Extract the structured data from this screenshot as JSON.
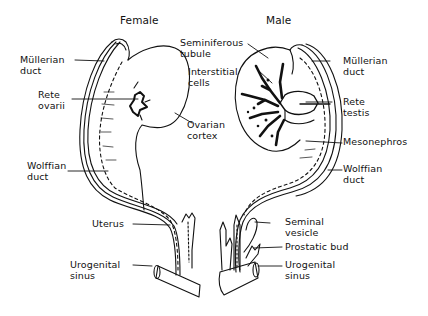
{
  "diagram": {
    "panels": {
      "female": {
        "title": "Female",
        "labels": {
          "mullerian_duct": "Müllerian\nduct",
          "rete_ovarii": "Rete\novarii",
          "ovarian_cortex": "Ovarian\ncortex",
          "wolffian_duct": "Wolffian\nduct",
          "uterus": "Uterus",
          "urogenital_sinus": "Urogenital\nsinus"
        }
      },
      "male": {
        "title": "Male",
        "labels": {
          "seminiferous_tubule": "Seminiferous\ntubule",
          "interstitial_cells": "Interstitial\ncells",
          "mullerian_duct": "Müllerian\nduct",
          "rete_testis": "Rete\ntestis",
          "mesonephros": "Mesonephros",
          "wolffian_duct": "Wolffian\nduct",
          "seminal_vesicle": "Seminal\nvesicle",
          "prostatic_bud": "Prostatic bud",
          "urogenital_sinus": "Urogenital\nsinus"
        }
      }
    },
    "colors": {
      "ink": "#111111",
      "background": "#ffffff"
    }
  }
}
